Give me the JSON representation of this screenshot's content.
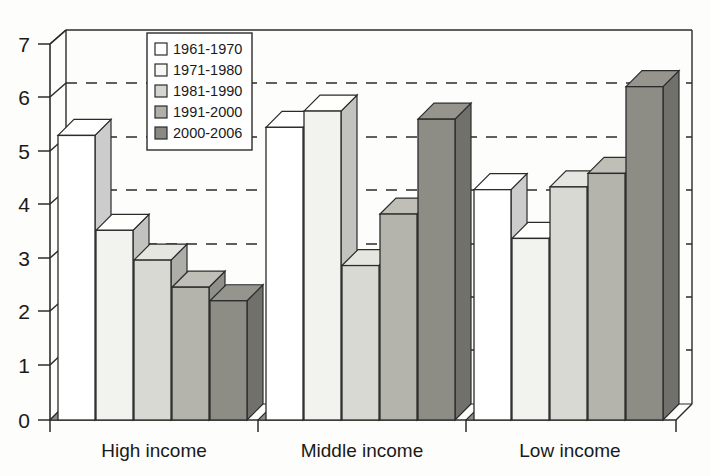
{
  "chart_data": {
    "type": "bar",
    "title": "",
    "subtitle": "",
    "xlabel": "",
    "ylabel": "",
    "categories": [
      "High income",
      "Middle income",
      "Low income"
    ],
    "series": [
      {
        "name": "1961-1970",
        "values": [
          5.25,
          5.4,
          4.25
        ],
        "color": "#ffffff"
      },
      {
        "name": "1971-1980",
        "values": [
          3.5,
          5.7,
          3.35
        ],
        "color": "#f2f2ee"
      },
      {
        "name": "1981-1990",
        "values": [
          2.95,
          2.85,
          4.3
        ],
        "color": "#d9d9d3"
      },
      {
        "name": "1991-2000",
        "values": [
          2.45,
          3.8,
          4.55
        ],
        "color": "#b4b4ad"
      },
      {
        "name": "2000-2006",
        "values": [
          2.2,
          5.55,
          6.15
        ],
        "color": "#8d8d86"
      }
    ],
    "ylim": [
      0,
      7
    ],
    "yticks": [
      0,
      1,
      2,
      3,
      4,
      5,
      6,
      7
    ],
    "ytick_labels": [
      "0",
      "1",
      "2",
      "3",
      "4",
      "5",
      "6",
      "7"
    ],
    "grid": true,
    "grid_style": "dashed-horizontal",
    "legend_position": "top-left-inside",
    "style": "3d-bar-grayscale"
  },
  "legend": {
    "entries": [
      {
        "label": "1961-1970",
        "swatch": "#ffffff"
      },
      {
        "label": "1971-1980",
        "swatch": "#f7f7f4"
      },
      {
        "label": "1981-1990",
        "swatch": "#d5d5cf"
      },
      {
        "label": "1991-2000",
        "swatch": "#b0b0a9"
      },
      {
        "label": "2000-2006",
        "swatch": "#8a8a83"
      }
    ]
  },
  "axes": {
    "y_tick_labels": [
      "7",
      "6",
      "5",
      "4",
      "3",
      "2",
      "1",
      "0"
    ],
    "x_tick_labels": [
      "High income",
      "Middle income",
      "Low income"
    ]
  }
}
